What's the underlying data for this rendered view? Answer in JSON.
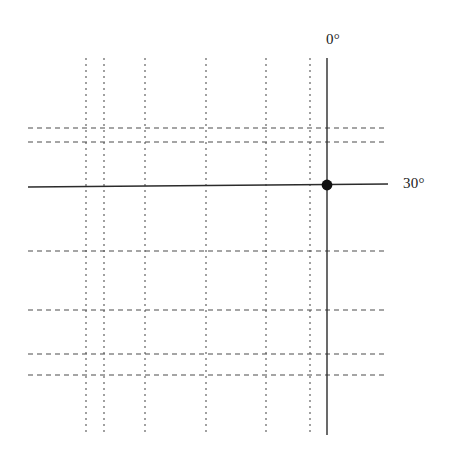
{
  "figure": {
    "title": "",
    "background_color": "#ffffff",
    "width": 451,
    "height": 460
  },
  "labels": {
    "vertical_axis": "0°",
    "horizontal_axis": "30°"
  },
  "chart_data": {
    "type": "scatter",
    "title": "",
    "xlabel": "",
    "ylabel": "",
    "grid": true,
    "legend": "none",
    "xlim": [
      0,
      451
    ],
    "ylim": [
      460,
      0
    ],
    "colors": {
      "solid_line": "#2b2b2b",
      "dashed_line": "#4d4d4d",
      "marker": "#111111",
      "text": "#1a1a1a",
      "background": "#ffffff"
    },
    "grid_lines": {
      "vertical_dashed_x": [
        86,
        104,
        145,
        206,
        266,
        310
      ],
      "horizontal_dashed_y": [
        128,
        142,
        251,
        310,
        354,
        375
      ],
      "vertical_extent_y": [
        58,
        435
      ],
      "horizontal_extent_x": [
        28,
        388
      ],
      "dash_pattern_vertical": "2 4",
      "dash_pattern_horizontal": "5 4"
    },
    "axes": {
      "solid_vertical": {
        "label": "0°",
        "x": 327,
        "y_start": 58,
        "y_end": 435,
        "stroke_width": 1.4
      },
      "solid_horizontal": {
        "label": "30°",
        "y_left": 187,
        "y_right": 184,
        "x_start": 28,
        "x_end": 388,
        "stroke_width": 1.4
      }
    },
    "points": [
      {
        "name": "intersection",
        "x": 327,
        "y": 185,
        "radius": 5.4,
        "filled": true,
        "color": "#111111"
      }
    ],
    "series": [
      {
        "name": "intersection-marker",
        "x": [
          327
        ],
        "y": [
          185
        ]
      }
    ]
  }
}
